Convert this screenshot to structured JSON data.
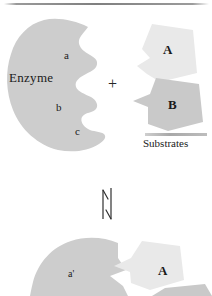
{
  "figure": {
    "type": "biochemistry-schematic",
    "top_rule": "horizontal-gray-rule"
  },
  "colors": {
    "background": "#ffffff",
    "enzyme_fill": "#cdcdcd",
    "substrate_a_fill": "#e9e9e9",
    "substrate_b_fill": "#c9c9c9",
    "text": "#1a1a1a",
    "rule": "#8f8f8f"
  },
  "panel_top": {
    "enzyme": {
      "label": "Enzyme",
      "site_labels": [
        "a",
        "b",
        "c"
      ]
    },
    "operator": "+",
    "substrates": {
      "caption": "Substrates",
      "items": [
        {
          "label": "A",
          "shade": "light"
        },
        {
          "label": "B",
          "shade": "dark"
        }
      ]
    }
  },
  "reaction_arrow": {
    "name": "equilibrium-double-arrow",
    "orientation": "vertical",
    "up_label": "",
    "down_label": ""
  },
  "panel_bottom": {
    "complex": {
      "enzyme_site_label": "a'",
      "bound_substrate_label": "A"
    }
  }
}
